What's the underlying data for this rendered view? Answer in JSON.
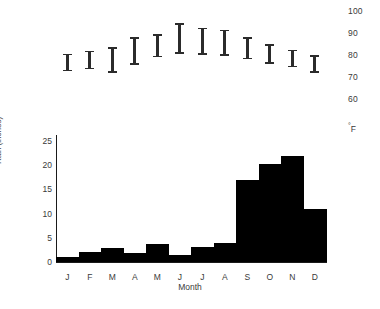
{
  "chart_data": {
    "type": "bar",
    "title": "",
    "subtitle": "",
    "categories": [
      "J",
      "F",
      "M",
      "A",
      "M",
      "J",
      "J",
      "A",
      "S",
      "O",
      "N",
      "D"
    ],
    "month_names": [
      "January",
      "February",
      "March",
      "April",
      "May",
      "June",
      "July",
      "August",
      "September",
      "October",
      "November",
      "December"
    ],
    "xlabel": "Month",
    "ylabel": "Rain (inches)",
    "ylim": [
      0,
      26
    ],
    "yticks": [
      0,
      5,
      10,
      15,
      20,
      25
    ],
    "ytick_labels": [
      "0",
      "5",
      "10",
      "15",
      "20",
      "25"
    ],
    "grid": false,
    "legend": "none",
    "values": [
      1.0,
      2.0,
      2.8,
      1.8,
      3.7,
      1.5,
      3.0,
      4.0,
      17.0,
      20.2,
      21.8,
      11.0
    ],
    "series": [
      {
        "name": "Rain (inches)",
        "type": "bar",
        "color": "#000000",
        "values": [
          1.0,
          2.0,
          2.8,
          1.8,
          3.7,
          1.5,
          3.0,
          4.0,
          17.0,
          20.2,
          21.8,
          11.0
        ]
      },
      {
        "name": "Temperature range (°F)",
        "type": "range-bar",
        "color": "#2b2b2b",
        "unit": "°F",
        "axis": "right",
        "ylim": [
          55,
          102
        ],
        "yticks": [
          60,
          70,
          80,
          90,
          100
        ],
        "ytick_labels": [
          "60",
          "70",
          "80",
          "90",
          "100"
        ],
        "low": [
          72.5,
          73.5,
          72.0,
          75.5,
          79.0,
          80.5,
          80.0,
          79.5,
          78.0,
          76.0,
          74.5,
          72.0
        ],
        "high": [
          80.5,
          82.0,
          83.5,
          88.0,
          89.5,
          94.5,
          92.5,
          91.5,
          88.0,
          85.0,
          82.5,
          80.0
        ]
      }
    ]
  },
  "temp_axis": {
    "labels": [
      "100",
      "90",
      "80",
      "70",
      "60"
    ],
    "unit_degree": "°",
    "unit_letter": "F"
  },
  "rain_axis": {
    "ticks": [
      "25",
      "20",
      "15",
      "10",
      "5",
      "0"
    ],
    "label": "Rain (inches)"
  },
  "x_axis": {
    "ticks": [
      "J",
      "F",
      "M",
      "A",
      "M",
      "J",
      "J",
      "A",
      "S",
      "O",
      "N",
      "D"
    ],
    "label": "Month"
  },
  "colors": {
    "bar": "#000000",
    "temp_bar": "#2b2b2b",
    "axis": "#1a1a1a",
    "text": "#3a3a3a",
    "background": "#ffffff"
  }
}
